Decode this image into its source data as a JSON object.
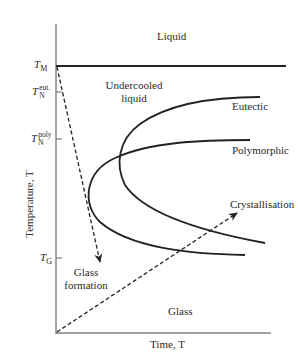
{
  "diagram": {
    "type": "TTT (time-temperature-transformation) diagram",
    "axes": {
      "y_label": "Temperature, T",
      "x_label": "Time, T"
    },
    "y_ticks": [
      {
        "symbol": "T",
        "sub": "M",
        "sup": "",
        "name": "melting-temperature"
      },
      {
        "symbol": "T",
        "sub": "N",
        "sup": "eut.",
        "name": "eutectic-nucleation-temperature"
      },
      {
        "symbol": "T",
        "sub": "N",
        "sup": "poly",
        "name": "polymorphic-nucleation-temperature"
      },
      {
        "symbol": "T",
        "sub": "G",
        "sup": "",
        "name": "glass-transition-temperature"
      }
    ],
    "regions": {
      "liquid": "Liquid",
      "undercooled_line1": "Undercooled",
      "undercooled_line2": "liquid",
      "glass": "Glass"
    },
    "curves": {
      "eutectic": "Eutectic",
      "polymorphic": "Polymorphic"
    },
    "arrows": {
      "glass_formation_line1": "Glass",
      "glass_formation_line2": "formation",
      "crystallisation": "Crystallisation"
    },
    "colors": {
      "line": "#222222",
      "axis": "#666666",
      "background": "#ffffff"
    }
  }
}
